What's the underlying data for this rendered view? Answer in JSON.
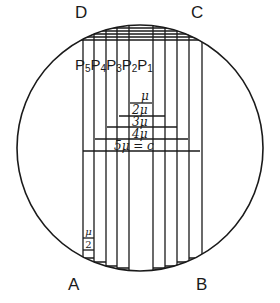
{
  "corners": {
    "A": "A",
    "B": "B",
    "C": "C",
    "D": "D"
  },
  "plates": [
    "P",
    "P",
    "P",
    "P",
    "P"
  ],
  "plate_indices": [
    "5",
    "4",
    "3",
    "2",
    "1"
  ],
  "levels": [
    "μ",
    "2μ",
    "3μ",
    "4μ",
    "5μ = c"
  ],
  "corner_fraction": {
    "numerator": "μ",
    "denominator": "2"
  },
  "colors": {
    "line": "#1a1a1a",
    "background": "#ffffff"
  }
}
